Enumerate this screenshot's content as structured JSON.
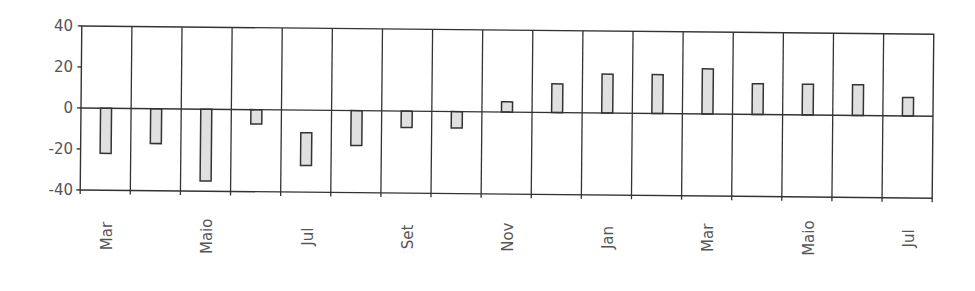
{
  "chart_data": {
    "type": "bar",
    "title": "",
    "xlabel": "",
    "ylabel": "",
    "ylim": [
      -40,
      40
    ],
    "yticks": [
      40,
      20,
      0,
      -20,
      -40
    ],
    "grid": {
      "vertical": true,
      "horizontal": false
    },
    "legend": null,
    "categories": [
      "Mar",
      "Abr",
      "Maio",
      "Jun",
      "Jul",
      "Ago",
      "Set",
      "Out",
      "Nov",
      "Dez",
      "Jan",
      "Fev",
      "Mar",
      "Abr",
      "Maio",
      "Jun",
      "Jul"
    ],
    "visible_xtick_labels": [
      "Mar",
      "",
      "Maio",
      "",
      "Jul",
      "",
      "Set",
      "",
      "Nov",
      "",
      "Jan",
      "",
      "Mar",
      "",
      "Maio",
      "",
      "Jul"
    ],
    "series": [
      {
        "name": "Série 1",
        "values": [
          -22,
          -17,
          -35,
          -7,
          -27,
          -17,
          -8,
          -8,
          5,
          14,
          19,
          19,
          22,
          15,
          15,
          15,
          9
        ],
        "bar_start": [
          0,
          0,
          0,
          0,
          -11,
          0,
          0,
          0,
          0,
          0,
          0,
          0,
          0,
          0,
          0,
          0,
          0
        ]
      }
    ],
    "colors": {
      "bar_fill": "#e0e0e0",
      "bar_stroke": "#333333",
      "axis": "#333333",
      "tick_text": "#555555"
    }
  }
}
